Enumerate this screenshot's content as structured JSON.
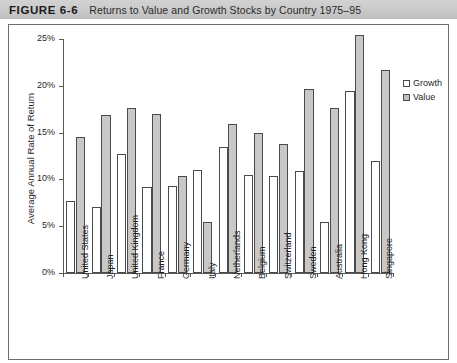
{
  "figure": {
    "label": "FIGURE 6-6",
    "title": "Returns to Value and Growth Stocks by Country 1975–95"
  },
  "legend": {
    "position": "top-right",
    "entries": [
      {
        "name": "growth",
        "label": "Growth",
        "color": "#ffffff"
      },
      {
        "name": "value",
        "label": "Value",
        "color": "#c8c8c8"
      }
    ]
  },
  "axis": {
    "y_title": "Average Annual Rate of Return",
    "y_ticks": [
      "0%",
      "5%",
      "10%",
      "15%",
      "20%",
      "25%"
    ]
  },
  "chart_data": {
    "type": "bar",
    "title": "Returns to Value and Growth Stocks by Country 1975–95",
    "xlabel": "",
    "ylabel": "Average Annual Rate of Return",
    "ylim": [
      0,
      25
    ],
    "ytick_values": [
      0,
      5,
      10,
      15,
      20,
      25
    ],
    "ytick_labels": [
      "0%",
      "5%",
      "10%",
      "15%",
      "20%",
      "25%"
    ],
    "grid": false,
    "legend_position": "top-right",
    "categories": [
      "United States",
      "Japan",
      "United Kingdom",
      "France",
      "Germany",
      "Italy",
      "Netherlands",
      "Belgium",
      "Switzerland",
      "Sweden",
      "Australia",
      "Hong Kong",
      "Singapore"
    ],
    "series": [
      {
        "name": "Growth",
        "color": "#ffffff",
        "values": [
          7.7,
          7.0,
          12.7,
          9.2,
          9.3,
          11.0,
          13.5,
          10.5,
          10.4,
          10.9,
          5.4,
          19.4,
          12.0
        ]
      },
      {
        "name": "Value",
        "color": "#c8c8c8",
        "values": [
          14.5,
          16.9,
          17.6,
          17.0,
          10.4,
          5.4,
          15.9,
          15.0,
          13.8,
          19.7,
          17.6,
          25.4,
          21.7
        ]
      }
    ]
  }
}
